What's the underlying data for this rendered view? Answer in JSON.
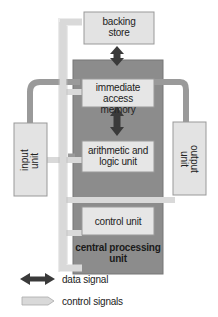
{
  "diagram": {
    "nodes": {
      "backing_store": "backing\nstore",
      "backing_store_l1": "backing",
      "backing_store_l2": "store",
      "memory_l1": "immediate access",
      "memory_l2": "memory",
      "alu_l1": "arithmetic and",
      "alu_l2": "logic unit",
      "control_unit": "control unit",
      "cpu_l1": "central processing",
      "cpu_l2": "unit",
      "input_l1": "input",
      "input_l2": "unit",
      "output_l1": "output",
      "output_l2": "unit"
    },
    "legend": {
      "data_signal": "data signal",
      "control_signals": "control signals"
    },
    "colors": {
      "cpu_box": "#8a8a8a",
      "cpu_inner": "#a0a0a0",
      "unit_box": "#e6e6e6",
      "control_path": "#d9d9d9",
      "data_arrow": "#3a3a3a",
      "io_link": "#9a9a9a"
    }
  }
}
